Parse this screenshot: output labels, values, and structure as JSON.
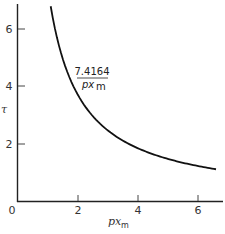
{
  "chart_data": {
    "type": "line",
    "title": "",
    "xlabel": "px_m",
    "ylabel": "τ",
    "xlim": [
      0,
      6.8
    ],
    "ylim": [
      0,
      7
    ],
    "x_ticks": [
      0,
      2,
      4,
      6
    ],
    "y_ticks": [
      2,
      4,
      6
    ],
    "grid": false,
    "series": [
      {
        "name": "7.4164/px_m",
        "formula": "tau = 7.4164 / px_m",
        "x": [
          1.09,
          1.25,
          1.5,
          1.75,
          2.0,
          2.5,
          3.0,
          3.5,
          4.0,
          4.5,
          5.0,
          5.5,
          6.0,
          6.6
        ],
        "y": [
          6.8,
          5.93,
          4.94,
          4.24,
          3.71,
          2.97,
          2.47,
          2.12,
          1.85,
          1.65,
          1.48,
          1.35,
          1.24,
          1.12
        ]
      }
    ],
    "annotations": [
      {
        "text_numerator": "7.4164",
        "text_denominator": "px_m",
        "x": 2.5,
        "y": 4.4
      }
    ]
  },
  "labels": {
    "origin": "0",
    "x_tick_2": "2",
    "x_tick_4": "4",
    "x_tick_6": "6",
    "y_tick_2": "2",
    "y_tick_4": "4",
    "y_tick_6": "6",
    "xlabel_main": "px",
    "xlabel_sub": "m",
    "ylabel": "τ",
    "annot_numerator": "7.4164",
    "annot_denom_main": "px",
    "annot_denom_sub": "m"
  }
}
